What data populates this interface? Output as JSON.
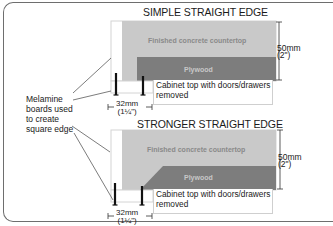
{
  "diagrams": [
    {
      "title": "SIMPLE STRAIGHT EDGE",
      "concrete_label": "Finished concrete countertop",
      "plywood_label": "Plywood",
      "height_dim": {
        "metric": "50mm",
        "imperial": "(2\")"
      },
      "width_dim": {
        "metric": "32mm",
        "imperial": "(1¼\")"
      },
      "cabinet_label_line1": "Cabinet top with doors/drawers",
      "cabinet_label_line2": "removed"
    },
    {
      "title": "STRONGER STRAIGHT EDGE",
      "concrete_label": "Finished concrete countertop",
      "plywood_label": "Plywood",
      "height_dim": {
        "metric": "50mm",
        "imperial": "(2\")"
      },
      "width_dim": {
        "metric": "32mm",
        "imperial": "(1¼\")"
      },
      "cabinet_label_line1": "Cabinet top with doors/drawers",
      "cabinet_label_line2": "removed"
    }
  ],
  "callout": {
    "line1": "Melamine",
    "line2": "boards used",
    "line3": "to create",
    "line4": "square edge"
  },
  "colors": {
    "concrete": "#c9c9c9",
    "plywood": "#7d7d7d",
    "melamine": "#ffffff",
    "outline": "#d4d4d4",
    "screw": "#111111"
  }
}
